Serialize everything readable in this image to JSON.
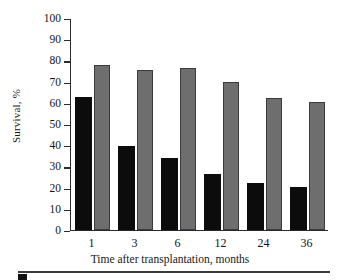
{
  "chart_data": {
    "type": "bar",
    "title": "",
    "subtitle": "",
    "xlabel": "Time after transplantation, months",
    "ylabel": "Survival, %",
    "categories": [
      "1",
      "3",
      "6",
      "12",
      "24",
      "36"
    ],
    "series": [
      {
        "name": "series-dark",
        "color": "#0c0c0c",
        "values": [
          63,
          40,
          34,
          26.5,
          22.5,
          20.5
        ]
      },
      {
        "name": "series-gray",
        "color": "#6e6e6e",
        "values": [
          78,
          76,
          77,
          70,
          62.5,
          60.5
        ]
      }
    ],
    "ylim": [
      0,
      100
    ],
    "yticks": [
      0,
      10,
      20,
      30,
      40,
      50,
      60,
      70,
      80,
      90,
      100
    ],
    "ytick_labels": [
      "0",
      "10",
      "20",
      "30",
      "40",
      "50",
      "60",
      "70",
      "80",
      "90",
      "100"
    ],
    "grid": false,
    "legend": "none"
  }
}
